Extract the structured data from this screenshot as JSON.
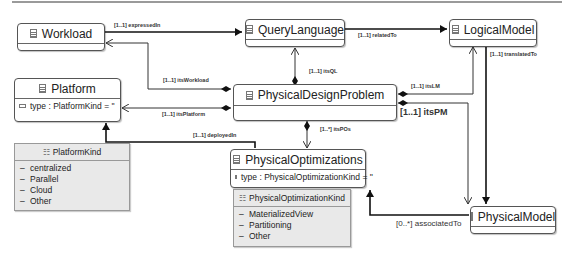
{
  "diagram": {
    "classes": {
      "workload": {
        "name": "Workload"
      },
      "query_language": {
        "name": "QueryLanguage"
      },
      "logical_model": {
        "name": "LogicalModel"
      },
      "platform": {
        "name": "Platform",
        "attribute": "type : PlatformKind = ''"
      },
      "physical_design_problem": {
        "name": "PhysicalDesignProblem"
      },
      "physical_optimizations": {
        "name": "PhysicalOptimizations",
        "attribute": "type : PhysicalOptimizationKind = ''"
      },
      "physical_model": {
        "name": "PhysicalModel"
      }
    },
    "enums": {
      "platform_kind": {
        "name": "PlatformKind",
        "literals": [
          "centralized",
          "Parallel",
          "Cloud",
          "Other"
        ]
      },
      "physical_optimization_kind": {
        "name": "PhysicalOptimizationKind",
        "literals": [
          "MaterializedView",
          "Partitioning",
          "Other"
        ]
      }
    },
    "associations": {
      "expressed_in": "[1..1] expressedIn",
      "related_to": "[1..1] relatedTo",
      "translated_to": "[1..1] translatedTo",
      "its_workload": "[1..1] itsWorkload",
      "its_ql": "[1..1] itsQL",
      "its_lm": "[1..1] itsLM",
      "its_platform": "[1..1] itsPlatform",
      "its_pm": "[1..1] itsPM",
      "its_pos": "[1..*] itsPOs",
      "deployed_in": "[1..1] deployedIn",
      "associated_to": "[0..*] associatedTo"
    }
  }
}
